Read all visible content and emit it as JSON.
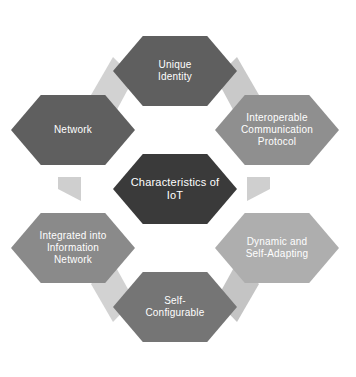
{
  "diagram": {
    "type": "hexagon-cluster",
    "title": "Characteristics of IoT",
    "background_color": "#ffffff",
    "text_color": "#ffffff",
    "bevel_color": "#c9c9c9",
    "center": {
      "id": "characteristics-of-iot",
      "label": "Characteristics of\nIoT",
      "color": "#3a3a3a",
      "cx": 175,
      "cy": 189,
      "rx": 62,
      "ry": 70
    },
    "nodes": [
      {
        "id": "unique-identity",
        "label": "Unique\nIdentity",
        "color": "#5f5f5f",
        "position": "top",
        "cx": 175,
        "cy": 71,
        "rx": 62,
        "ry": 70
      },
      {
        "id": "interoperable-communication-protocol",
        "label": "Interoperable\nCommunication\nProtocol",
        "color": "#8f8f8f",
        "position": "top-right",
        "cx": 277,
        "cy": 130,
        "rx": 62,
        "ry": 70
      },
      {
        "id": "dynamic-and-self-adapting",
        "label": "Dynamic and\nSelf-Adapting",
        "color": "#aeaeae",
        "position": "bottom-right",
        "cx": 277,
        "cy": 248,
        "rx": 62,
        "ry": 70
      },
      {
        "id": "self-configurable",
        "label": "Self-\nConfigurable",
        "color": "#757575",
        "position": "bottom",
        "cx": 175,
        "cy": 307,
        "rx": 62,
        "ry": 70
      },
      {
        "id": "integrated-into-information-network",
        "label": "Integrated into\nInformation\nNetwork",
        "color": "#8a8a8a",
        "position": "bottom-left",
        "cx": 73,
        "cy": 248,
        "rx": 62,
        "ry": 70
      },
      {
        "id": "network",
        "label": "Network",
        "color": "#5f5f5f",
        "position": "top-left",
        "cx": 73,
        "cy": 130,
        "rx": 62,
        "ry": 70
      }
    ],
    "bevels": [
      {
        "id": "bevel-top-right",
        "points": "216,78 237,117 259,95 237,57",
        "color": "#c9c9c9"
      },
      {
        "id": "bevel-right",
        "points": "247,177 247,201 270,189 270,177",
        "color": "#cfcfcf"
      },
      {
        "id": "bevel-bottom-right",
        "points": "237,262 259,284 237,322 216,300",
        "color": "#c4c4c4"
      },
      {
        "id": "bevel-bottom-left",
        "points": "134,300 113,322 91,284 113,262",
        "color": "#d2d2d2"
      },
      {
        "id": "bevel-left",
        "points": "81,177 81,201 58,189 58,177",
        "color": "#cfcfcf"
      },
      {
        "id": "bevel-top-left",
        "points": "113,57 91,95 113,117 134,78",
        "color": "#d2d2d2"
      }
    ]
  }
}
